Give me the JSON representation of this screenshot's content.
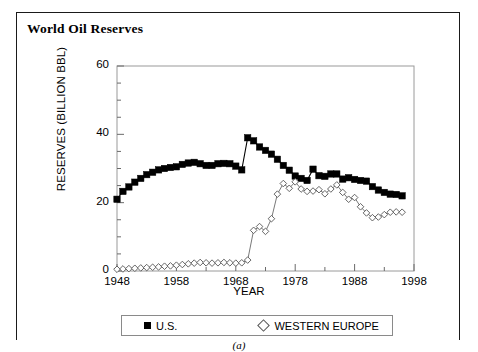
{
  "figure": {
    "title": "World Oil Reserves",
    "sub_caption": "(a)"
  },
  "legend": {
    "items": [
      {
        "label": "U.S.",
        "marker": "filled-square-marker",
        "color": "#000000"
      },
      {
        "label": "WESTERN EUROPE",
        "marker": "open-diamond-marker",
        "color": "#555555"
      }
    ]
  },
  "axes": {
    "x_title": "YEAR",
    "y_title": "RESERVES (BILLION BBL)",
    "x_ticks": [
      "1948",
      "1958",
      "1968",
      "1978",
      "1988",
      "1998"
    ],
    "y_ticks": [
      "0",
      "20",
      "40",
      "60"
    ]
  },
  "chart_data": {
    "type": "line",
    "title": "World Oil Reserves",
    "xlabel": "YEAR",
    "ylabel": "RESERVES (BILLION BBL)",
    "xlim": [
      1948,
      1998
    ],
    "ylim": [
      0,
      60
    ],
    "x_ticks": [
      1948,
      1958,
      1968,
      1978,
      1988,
      1998
    ],
    "y_ticks": [
      0,
      20,
      40,
      60
    ],
    "y_minor_tick_step": 5,
    "grid": false,
    "legend_position": "below-plot",
    "x": [
      1948,
      1949,
      1950,
      1951,
      1952,
      1953,
      1954,
      1955,
      1956,
      1957,
      1958,
      1959,
      1960,
      1961,
      1962,
      1963,
      1964,
      1965,
      1966,
      1967,
      1968,
      1969,
      1970,
      1971,
      1972,
      1973,
      1974,
      1975,
      1976,
      1977,
      1978,
      1979,
      1980,
      1981,
      1982,
      1983,
      1984,
      1985,
      1986,
      1987,
      1988,
      1989,
      1990,
      1991,
      1992,
      1993,
      1994,
      1995,
      1996
    ],
    "series": [
      {
        "name": "U.S.",
        "marker": "filled-square-marker",
        "color": "#000000",
        "values": [
          21.0,
          23.3,
          24.6,
          26.0,
          27.1,
          28.2,
          28.9,
          29.6,
          30.0,
          30.3,
          30.5,
          31.2,
          31.6,
          31.8,
          31.4,
          30.9,
          30.9,
          31.4,
          31.5,
          31.4,
          30.7,
          29.6,
          39.0,
          38.1,
          36.3,
          35.3,
          34.2,
          32.7,
          30.9,
          29.5,
          27.8,
          27.1,
          26.5,
          29.8,
          27.9,
          27.7,
          28.4,
          28.4,
          26.9,
          27.3,
          26.8,
          26.5,
          26.3,
          24.7,
          23.7,
          23.0,
          22.5,
          22.4,
          22.0
        ]
      },
      {
        "name": "WESTERN EUROPE",
        "marker": "open-diamond-marker",
        "color": "#555555",
        "values": [
          0.5,
          0.6,
          0.7,
          0.8,
          0.9,
          1.0,
          1.1,
          1.2,
          1.4,
          1.5,
          1.7,
          1.9,
          2.1,
          2.3,
          2.5,
          2.4,
          2.3,
          2.4,
          2.5,
          2.4,
          2.3,
          2.4,
          3.2,
          11.9,
          13.0,
          11.6,
          15.3,
          22.5,
          25.6,
          24.2,
          26.1,
          24.0,
          23.3,
          23.4,
          23.8,
          22.6,
          24.0,
          25.2,
          23.0,
          21.0,
          21.5,
          18.8,
          17.0,
          15.6,
          15.8,
          16.5,
          17.2,
          17.3,
          17.2
        ]
      }
    ]
  }
}
